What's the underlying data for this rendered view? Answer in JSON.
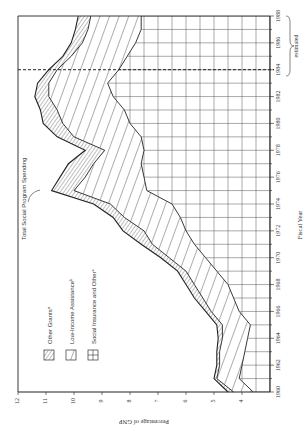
{
  "chart_data": {
    "type": "area",
    "orientation": "rotated-90-ccw",
    "title": "",
    "xlabel": "Fiscal Year",
    "ylabel": "Percentage of GNP",
    "x_ticks": [
      "1960",
      "1962",
      "1964",
      "1966",
      "1968",
      "1970",
      "1972",
      "1974",
      "1976",
      "1978",
      "1980",
      "1982",
      "1984",
      "1986",
      "1988"
    ],
    "y_ticks": [
      "3",
      "4",
      "5",
      "6",
      "7",
      "8",
      "9",
      "10",
      "11",
      "12"
    ],
    "xlim": [
      1960,
      1988
    ],
    "ylim": [
      3,
      12
    ],
    "grid": true,
    "estimate_marker": {
      "year": 1984,
      "label": "estimated",
      "range": [
        1984,
        1988
      ]
    },
    "annotation": {
      "text": "Total Social Program Spending",
      "year": 1975
    },
    "legend": [
      {
        "name": "Other Grants",
        "note": "a",
        "pattern": "fine-diagonal-hatch"
      },
      {
        "name": "Low-Income Assistance",
        "note": "b",
        "pattern": "wide-diagonal-hatch"
      },
      {
        "name": "Social Insurance and Other",
        "note": "c",
        "pattern": "grid"
      }
    ],
    "x": [
      1960,
      1961,
      1962,
      1963,
      1964,
      1965,
      1966,
      1967,
      1968,
      1969,
      1970,
      1971,
      1972,
      1973,
      1974,
      1975,
      1976,
      1977,
      1978,
      1979,
      1980,
      1981,
      1982,
      1983,
      1984,
      1985,
      1986,
      1987,
      1988
    ],
    "series_cumulative": [
      {
        "name": "Social Insurance and Other",
        "values": [
          3.6,
          4.1,
          4.0,
          3.9,
          3.8,
          3.7,
          4.1,
          4.3,
          4.5,
          4.9,
          5.3,
          5.7,
          6.0,
          6.2,
          6.5,
          7.4,
          7.5,
          7.6,
          7.5,
          7.6,
          8.0,
          8.2,
          8.6,
          8.8,
          8.4,
          8.1,
          7.8,
          7.6,
          7.6
        ]
      },
      {
        "name": "Low-Income Assistance",
        "values": [
          4.3,
          4.9,
          4.8,
          4.8,
          4.7,
          4.7,
          5.1,
          5.4,
          5.7,
          6.0,
          6.6,
          7.2,
          7.5,
          8.2,
          8.7,
          10.0,
          9.6,
          9.3,
          8.9,
          10.0,
          10.4,
          10.6,
          10.9,
          10.9,
          10.6,
          10.1,
          9.7,
          9.5,
          9.4
        ]
      },
      {
        "name": "Other Grants",
        "values": [
          4.5,
          5.0,
          4.9,
          4.9,
          4.85,
          4.9,
          5.3,
          5.7,
          6.0,
          6.3,
          6.9,
          7.6,
          8.25,
          8.6,
          9.3,
          10.8,
          10.5,
          10.2,
          9.6,
          10.6,
          11.1,
          11.2,
          11.4,
          11.3,
          10.9,
          10.4,
          10.1,
          9.95,
          9.85
        ]
      }
    ]
  }
}
